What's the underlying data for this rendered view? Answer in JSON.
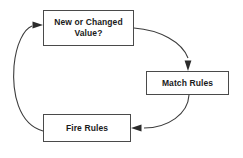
{
  "diagram": {
    "type": "flowchart-cycle",
    "background_color": "#ffffff",
    "line_color": "#3c3c3c",
    "text_color": "#1a1a1a",
    "nodes": [
      {
        "id": "new-or-changed",
        "label": "New or Changed\nValue?"
      },
      {
        "id": "match-rules",
        "label": "Match Rules"
      },
      {
        "id": "fire-rules",
        "label": "Fire Rules"
      }
    ],
    "edges": [
      {
        "id": "edge-new-to-match",
        "from": "new-or-changed",
        "to": "match-rules",
        "style": "curved",
        "arrowhead": "down"
      },
      {
        "id": "edge-match-to-fire",
        "from": "match-rules",
        "to": "fire-rules",
        "style": "curved",
        "arrowhead": "left"
      },
      {
        "id": "edge-fire-to-new",
        "from": "fire-rules",
        "to": "new-or-changed",
        "style": "curved",
        "arrowhead": "right"
      }
    ]
  }
}
